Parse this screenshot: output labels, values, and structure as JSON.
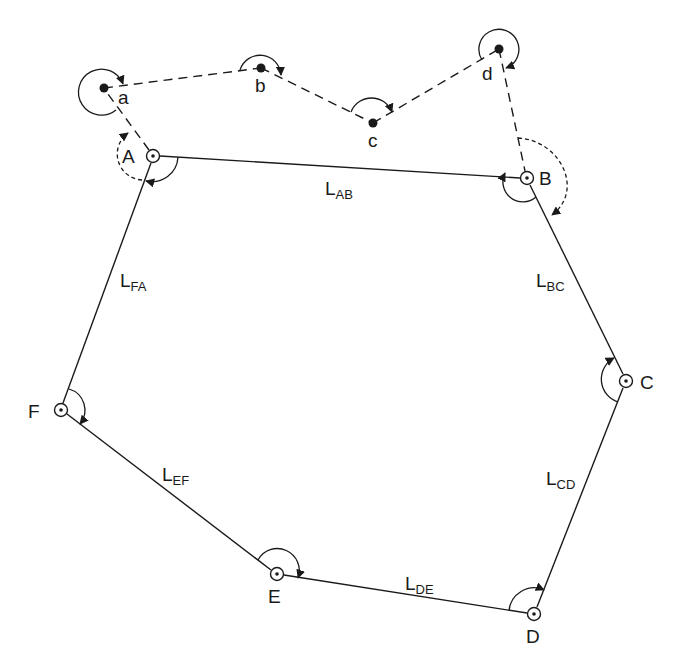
{
  "diagram": {
    "type": "closed traverse with connecting open traverse",
    "stations": [
      {
        "id": "A",
        "label": "A",
        "x": 153,
        "y": 156,
        "symbol": "station-circle"
      },
      {
        "id": "B",
        "label": "B",
        "x": 527,
        "y": 178,
        "symbol": "station-circle"
      },
      {
        "id": "C",
        "label": "C",
        "x": 626,
        "y": 381,
        "symbol": "station-circle"
      },
      {
        "id": "D",
        "label": "D",
        "x": 534,
        "y": 614,
        "symbol": "station-circle"
      },
      {
        "id": "E",
        "label": "E",
        "x": 277,
        "y": 574,
        "symbol": "station-circle"
      },
      {
        "id": "F",
        "label": "F",
        "x": 61,
        "y": 410,
        "symbol": "station-circle"
      }
    ],
    "aux_points": [
      {
        "id": "a",
        "label": "a",
        "x": 104,
        "y": 88
      },
      {
        "id": "b",
        "label": "b",
        "x": 261,
        "y": 68
      },
      {
        "id": "c",
        "label": "c",
        "x": 373,
        "y": 123
      },
      {
        "id": "d",
        "label": "d",
        "x": 499,
        "y": 49
      }
    ],
    "legs": [
      {
        "id": "AB",
        "label": "L",
        "sub": "AB"
      },
      {
        "id": "BC",
        "label": "L",
        "sub": "BC"
      },
      {
        "id": "CD",
        "label": "L",
        "sub": "CD"
      },
      {
        "id": "DE",
        "label": "L",
        "sub": "DE"
      },
      {
        "id": "EF",
        "label": "L",
        "sub": "EF"
      },
      {
        "id": "FA",
        "label": "L",
        "sub": "FA"
      }
    ],
    "colors": {
      "line": "#1a1a1a",
      "background": "#ffffff"
    }
  }
}
